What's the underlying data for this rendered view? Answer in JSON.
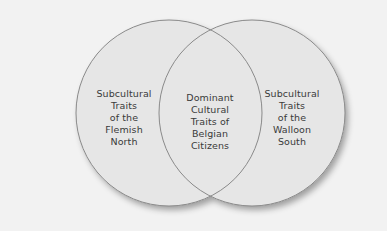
{
  "diagram": {
    "type": "venn",
    "colors": {
      "background": "#f2f2f2",
      "circle_fill": "#e6e6e6",
      "circle_stroke": "#8a8a8a",
      "text": "#3a3a3a"
    },
    "sets": [
      {
        "id": "flemish",
        "label": "Subcultural\nTraits\nof the\nFlemish\nNorth"
      },
      {
        "id": "walloon",
        "label": "Subcultural\nTraits\nof the\nWalloon\nSouth"
      }
    ],
    "intersection": {
      "label": "Dominant\nCultural\nTraits of\nBelgian\nCitizens"
    }
  }
}
